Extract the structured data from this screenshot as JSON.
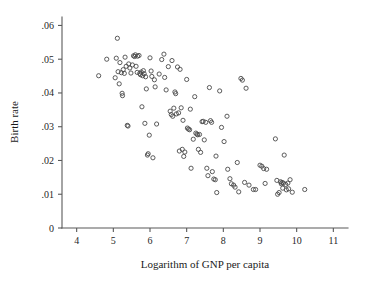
{
  "chart_data": {
    "type": "scatter",
    "title": "",
    "xlabel": "Logarithm of GNP per capita",
    "ylabel": "Birth rate",
    "xlim": [
      3.6,
      11.4
    ],
    "ylim": [
      0,
      0.0625
    ],
    "grid": false,
    "legend": null,
    "xticks": [
      4,
      5,
      6,
      7,
      8,
      9,
      10,
      11
    ],
    "xtick_labels": [
      "4",
      "5",
      "6",
      "7",
      "8",
      "9",
      "10",
      "11"
    ],
    "yticks": [
      0,
      0.01,
      0.02,
      0.03,
      0.04,
      0.05,
      0.06
    ],
    "ytick_labels": [
      "0",
      ".01",
      ".02",
      ".03",
      ".04",
      ".05",
      ".06"
    ],
    "marker": "open-circle",
    "marker_color": "#4a4a4a",
    "n_points": 134,
    "points": [
      [
        4.6,
        0.0451
      ],
      [
        4.82,
        0.05
      ],
      [
        5.05,
        0.0445
      ],
      [
        5.08,
        0.0503
      ],
      [
        5.11,
        0.0562
      ],
      [
        5.13,
        0.0463
      ],
      [
        5.16,
        0.0427
      ],
      [
        5.18,
        0.049
      ],
      [
        5.22,
        0.046
      ],
      [
        5.24,
        0.0399
      ],
      [
        5.25,
        0.0392
      ],
      [
        5.27,
        0.0469
      ],
      [
        5.3,
        0.0458
      ],
      [
        5.32,
        0.0506
      ],
      [
        5.35,
        0.0479
      ],
      [
        5.38,
        0.0304
      ],
      [
        5.4,
        0.0302
      ],
      [
        5.42,
        0.0486
      ],
      [
        5.45,
        0.0474
      ],
      [
        5.48,
        0.0459
      ],
      [
        5.52,
        0.0483
      ],
      [
        5.55,
        0.051
      ],
      [
        5.58,
        0.0508
      ],
      [
        5.6,
        0.0513
      ],
      [
        5.62,
        0.0479
      ],
      [
        5.65,
        0.0461
      ],
      [
        5.66,
        0.0509
      ],
      [
        5.7,
        0.0511
      ],
      [
        5.72,
        0.0458
      ],
      [
        5.74,
        0.0454
      ],
      [
        5.76,
        0.0462
      ],
      [
        5.78,
        0.0359
      ],
      [
        5.8,
        0.0451
      ],
      [
        5.82,
        0.0466
      ],
      [
        5.84,
        0.0457
      ],
      [
        5.86,
        0.031
      ],
      [
        5.88,
        0.0448
      ],
      [
        5.9,
        0.0412
      ],
      [
        5.93,
        0.0216
      ],
      [
        5.95,
        0.022
      ],
      [
        5.98,
        0.0275
      ],
      [
        6.0,
        0.0504
      ],
      [
        6.03,
        0.0465
      ],
      [
        6.05,
        0.0449
      ],
      [
        6.08,
        0.0208
      ],
      [
        6.12,
        0.0439
      ],
      [
        6.14,
        0.0418
      ],
      [
        6.18,
        0.0308
      ],
      [
        6.25,
        0.0456
      ],
      [
        6.32,
        0.0499
      ],
      [
        6.38,
        0.0515
      ],
      [
        6.4,
        0.0446
      ],
      [
        6.44,
        0.0409
      ],
      [
        6.5,
        0.0478
      ],
      [
        6.55,
        0.0346
      ],
      [
        6.58,
        0.0336
      ],
      [
        6.6,
        0.0496
      ],
      [
        6.62,
        0.0331
      ],
      [
        6.65,
        0.0355
      ],
      [
        6.68,
        0.0403
      ],
      [
        6.7,
        0.0398
      ],
      [
        6.72,
        0.0338
      ],
      [
        6.75,
        0.0477
      ],
      [
        6.78,
        0.0341
      ],
      [
        6.8,
        0.0228
      ],
      [
        6.82,
        0.047
      ],
      [
        6.85,
        0.0356
      ],
      [
        6.88,
        0.0233
      ],
      [
        6.9,
        0.0319
      ],
      [
        6.92,
        0.0212
      ],
      [
        6.95,
        0.0225
      ],
      [
        7.0,
        0.044
      ],
      [
        7.02,
        0.0296
      ],
      [
        7.05,
        0.0293
      ],
      [
        7.08,
        0.0291
      ],
      [
        7.1,
        0.0352
      ],
      [
        7.12,
        0.0177
      ],
      [
        7.18,
        0.0263
      ],
      [
        7.22,
        0.0389
      ],
      [
        7.25,
        0.0281
      ],
      [
        7.28,
        0.0278
      ],
      [
        7.3,
        0.0276
      ],
      [
        7.32,
        0.0233
      ],
      [
        7.35,
        0.0277
      ],
      [
        7.38,
        0.0224
      ],
      [
        7.42,
        0.0315
      ],
      [
        7.45,
        0.0316
      ],
      [
        7.48,
        0.0261
      ],
      [
        7.52,
        0.0313
      ],
      [
        7.55,
        0.0177
      ],
      [
        7.58,
        0.0155
      ],
      [
        7.62,
        0.0416
      ],
      [
        7.65,
        0.0318
      ],
      [
        7.68,
        0.0313
      ],
      [
        7.7,
        0.0167
      ],
      [
        7.74,
        0.0145
      ],
      [
        7.78,
        0.0143
      ],
      [
        7.8,
        0.0213
      ],
      [
        7.82,
        0.0105
      ],
      [
        7.9,
        0.0406
      ],
      [
        7.95,
        0.0298
      ],
      [
        8.02,
        0.0256
      ],
      [
        8.1,
        0.0331
      ],
      [
        8.12,
        0.0174
      ],
      [
        8.18,
        0.0146
      ],
      [
        8.22,
        0.0131
      ],
      [
        8.28,
        0.0127
      ],
      [
        8.32,
        0.0121
      ],
      [
        8.38,
        0.0194
      ],
      [
        8.42,
        0.0107
      ],
      [
        8.48,
        0.0443
      ],
      [
        8.52,
        0.0438
      ],
      [
        8.58,
        0.0135
      ],
      [
        8.62,
        0.0414
      ],
      [
        8.7,
        0.0127
      ],
      [
        8.82,
        0.0114
      ],
      [
        8.88,
        0.0114
      ],
      [
        9.0,
        0.0186
      ],
      [
        9.05,
        0.0183
      ],
      [
        9.1,
        0.0176
      ],
      [
        9.14,
        0.0132
      ],
      [
        9.18,
        0.0174
      ],
      [
        9.42,
        0.0264
      ],
      [
        9.46,
        0.0141
      ],
      [
        9.48,
        0.01
      ],
      [
        9.52,
        0.0105
      ],
      [
        9.56,
        0.0137
      ],
      [
        9.58,
        0.0131
      ],
      [
        9.6,
        0.0135
      ],
      [
        9.62,
        0.0118
      ],
      [
        9.64,
        0.0133
      ],
      [
        9.66,
        0.0216
      ],
      [
        9.7,
        0.0129
      ],
      [
        9.72,
        0.0113
      ],
      [
        9.76,
        0.0133
      ],
      [
        9.78,
        0.0116
      ],
      [
        9.82,
        0.0143
      ],
      [
        9.88,
        0.0106
      ],
      [
        10.22,
        0.0114
      ]
    ]
  },
  "figure": {
    "background_color": "#ffffff",
    "marker_stroke_color": "#4a4a4a",
    "axis_color": "#595959"
  }
}
